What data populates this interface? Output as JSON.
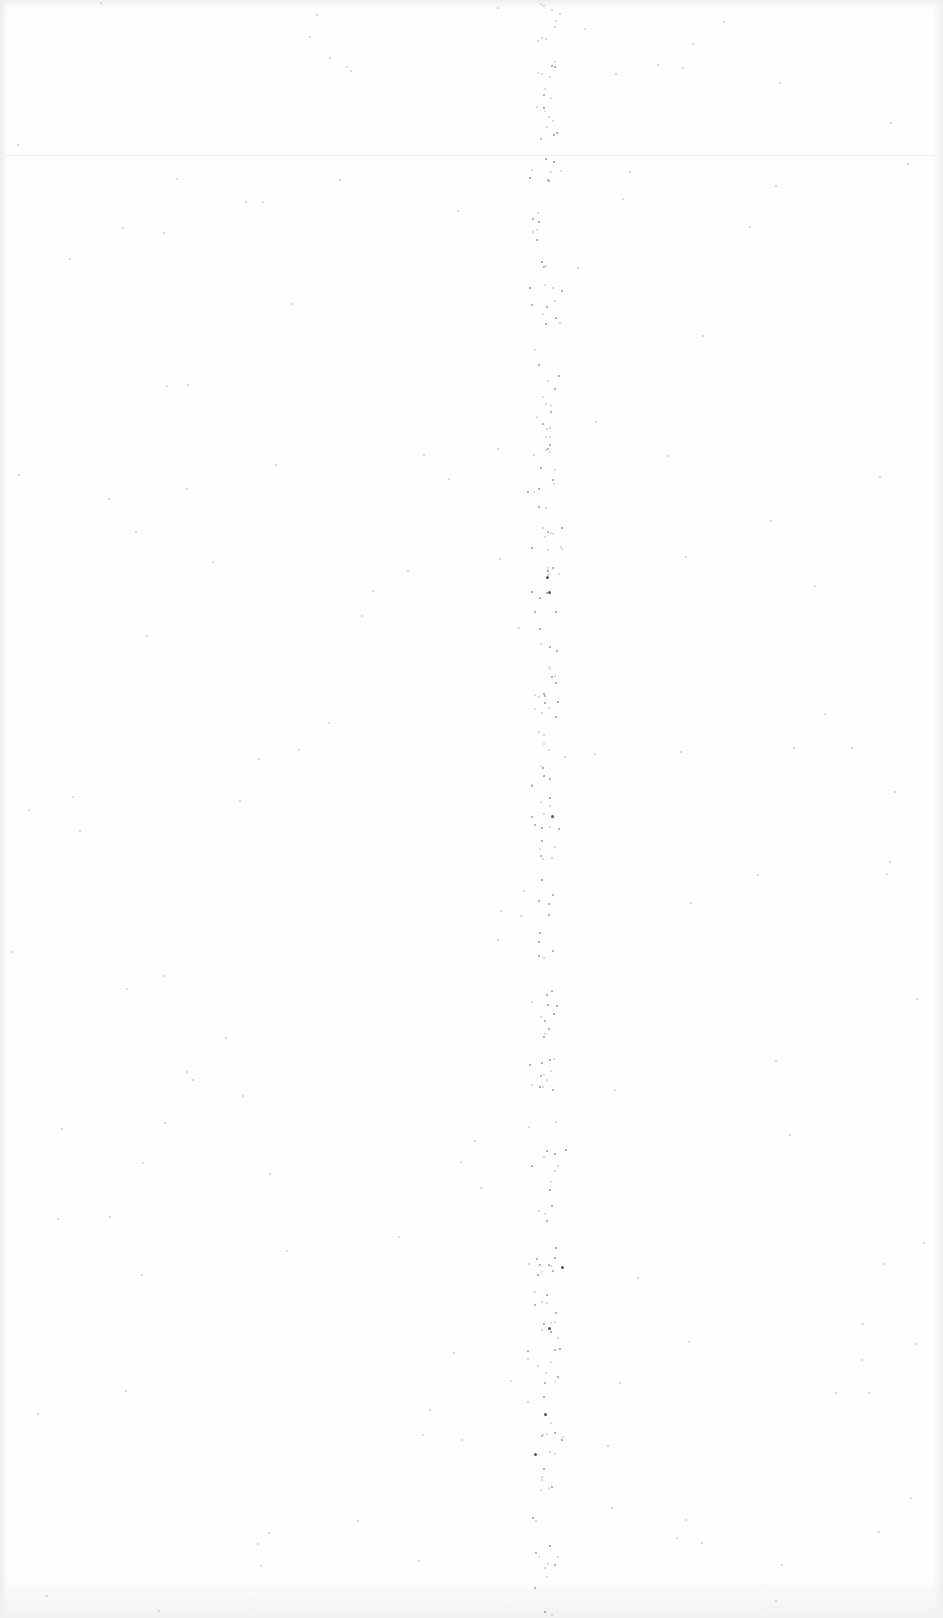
{
  "page": {
    "type": "blank-scanned-page",
    "background_color": "#fefefe",
    "speck_color": "#9a9a9a",
    "text_content": []
  }
}
